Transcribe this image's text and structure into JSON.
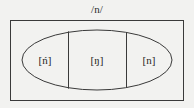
{
  "diagram": {
    "title": "/n/",
    "title_description": "phoneme-slash-notation",
    "outer_shape": "rectangle",
    "inner_shape": "ellipse",
    "divider_count": 2,
    "stroke_color": "#3a3a3a",
    "fill_color": "#f2f2f0",
    "background_color": "#f2f2f0",
    "cells": [
      {
        "label": "[ń]",
        "name": "palatal-nasal-allophone"
      },
      {
        "label": "[ŋ]",
        "name": "velar-nasal-allophone"
      },
      {
        "label": "[n]",
        "name": "alveolar-nasal-allophone"
      }
    ]
  }
}
